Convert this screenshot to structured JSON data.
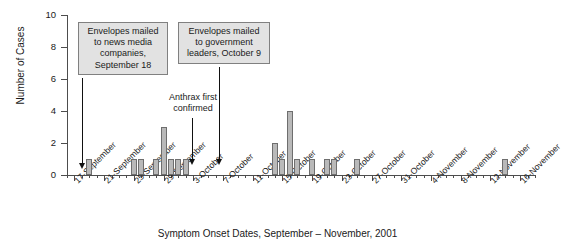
{
  "chart_data": {
    "type": "bar",
    "title": "",
    "caption": "Symptom Onset Dates, September – November, 2001",
    "xlabel": "Symptom Onset Dates, September – November, 2001",
    "ylabel": "Number of Cases",
    "ylim": [
      0,
      10
    ],
    "yticks": [
      0,
      2,
      4,
      6,
      8,
      10
    ],
    "ytick_labels": [
      "0",
      "2",
      "4",
      "6",
      "8",
      "10"
    ],
    "grid": false,
    "legend": null,
    "xtick_labels": [
      "17-September",
      "21-September",
      "25-September",
      "29-September",
      "3-October",
      "7-October",
      "11-October",
      "15-October",
      "19-October",
      "23-October",
      "27-October",
      "31-October",
      "4-November",
      "8-November",
      "12-November",
      "16-November"
    ],
    "x_axis_start": "16-September",
    "x_axis_end": "18-November",
    "xtick_interval_days": 4,
    "bar_color": "#b9b9b9",
    "bar_edge_color": "#6e6e6e",
    "categories": [
      "19-September",
      "25-September",
      "26-September",
      "28-September",
      "29-September",
      "30-September",
      "1-October",
      "2-October",
      "14-October",
      "15-October",
      "16-October",
      "17-October",
      "19-October",
      "21-October",
      "22-October",
      "25-October",
      "14-November"
    ],
    "values": [
      1,
      1,
      1,
      1,
      3,
      1,
      1,
      1,
      2,
      1,
      4,
      1,
      1,
      1,
      1,
      1,
      1
    ],
    "annotations": [
      {
        "id": "envelopes-news-media",
        "text": "Envelopes mailed to news media companies, September 18",
        "lines": [
          "Envelopes mailed",
          "to news media",
          "companies,",
          "September 18"
        ],
        "points_to": "18-September",
        "style": "box"
      },
      {
        "id": "envelopes-government",
        "text": "Envelopes mailed to government leaders, October 9",
        "lines": [
          "Envelopes mailed",
          "to government",
          "leaders, October 9"
        ],
        "points_to": "9-October",
        "style": "box"
      },
      {
        "id": "anthrax-first-confirmed",
        "text": "Anthrax first confirmed",
        "lines": [
          "Anthrax first",
          "confirmed"
        ],
        "points_to": "4-October",
        "style": "plain"
      }
    ]
  }
}
